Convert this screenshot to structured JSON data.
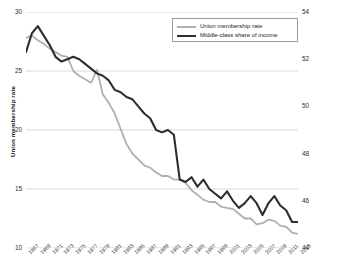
{
  "chart_data": {
    "type": "line",
    "title": "",
    "xlabel": "",
    "grid": "horizontal",
    "legend_position": "top-center-right",
    "x": [
      1967,
      1968,
      1969,
      1970,
      1971,
      1972,
      1973,
      1974,
      1975,
      1976,
      1977,
      1978,
      1979,
      1980,
      1981,
      1982,
      1983,
      1984,
      1985,
      1986,
      1987,
      1988,
      1989,
      1990,
      1991,
      1992,
      1993,
      1994,
      1995,
      1996,
      1997,
      1998,
      1999,
      2000,
      2001,
      2002,
      2003,
      2004,
      2005,
      2006,
      2007,
      2008,
      2009,
      2010,
      2011,
      2012,
      2013
    ],
    "xtick_labels": [
      "1967",
      "1969",
      "1971",
      "1973",
      "1975",
      "1977",
      "1979",
      "1981",
      "1983",
      "1985",
      "1987",
      "1989",
      "1991",
      "1993",
      "1995",
      "1997",
      "1999",
      "2001",
      "2003",
      "2005",
      "2007",
      "2009",
      "2011",
      "2013"
    ],
    "axes": {
      "left": {
        "label": "Union membership rate",
        "ticks": [
          10,
          15,
          20,
          25,
          30
        ],
        "ylim": [
          10,
          30
        ]
      },
      "right": {
        "label": "Middle-class share of aggregate income",
        "ticks": [
          44,
          46,
          48,
          50,
          52,
          54
        ],
        "ylim": [
          44,
          54
        ]
      }
    },
    "series": [
      {
        "name": "Union membership rate",
        "axis": "left",
        "color": "#b0b0b0",
        "values": [
          27.8,
          28.0,
          27.6,
          27.3,
          26.9,
          26.6,
          26.3,
          26.2,
          25.0,
          24.6,
          24.3,
          24.0,
          25.1,
          23.0,
          22.3,
          21.4,
          20.1,
          18.8,
          18.0,
          17.5,
          17.0,
          16.8,
          16.4,
          16.1,
          16.1,
          15.8,
          15.8,
          15.5,
          14.9,
          14.5,
          14.1,
          13.9,
          13.9,
          13.5,
          13.4,
          13.3,
          12.9,
          12.5,
          12.5,
          12.0,
          12.1,
          12.4,
          12.3,
          11.9,
          11.8,
          11.3,
          11.2
        ]
      },
      {
        "name": "Middle-class share of income",
        "axis": "right",
        "color": "#2e2e2e",
        "values": [
          52.3,
          53.1,
          53.4,
          53.0,
          52.6,
          52.1,
          51.9,
          52.0,
          52.1,
          52.0,
          51.8,
          51.6,
          51.4,
          51.3,
          51.1,
          50.7,
          50.6,
          50.4,
          50.3,
          50.0,
          49.7,
          49.5,
          49.0,
          48.9,
          49.0,
          48.8,
          46.9,
          46.8,
          47.0,
          46.6,
          46.9,
          46.5,
          46.3,
          46.1,
          46.4,
          46.0,
          45.7,
          45.9,
          46.2,
          45.9,
          45.4,
          45.9,
          46.2,
          45.8,
          45.6,
          45.1,
          45.1
        ]
      }
    ]
  },
  "legend": {
    "items": [
      {
        "label": "Union membership rate"
      },
      {
        "label": "Middle-class share of income"
      }
    ]
  }
}
